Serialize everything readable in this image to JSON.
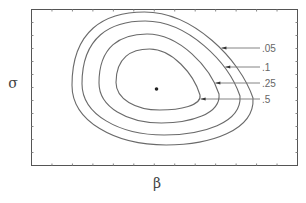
{
  "chart_data": {
    "type": "contour",
    "title": "",
    "xlabel": "β",
    "ylabel": "σ",
    "grid": false,
    "xticks_labeled": false,
    "yticks_labeled": false,
    "mode": {
      "label": "mode",
      "x": 0.47,
      "y": 0.51
    },
    "contours": [
      {
        "level": ".05",
        "label": ".05"
      },
      {
        "level": ".1",
        "label": ".1"
      },
      {
        "level": ".25",
        "label": ".25"
      },
      {
        "level": ".5",
        "label": ".5"
      }
    ],
    "label_placement": "right"
  }
}
